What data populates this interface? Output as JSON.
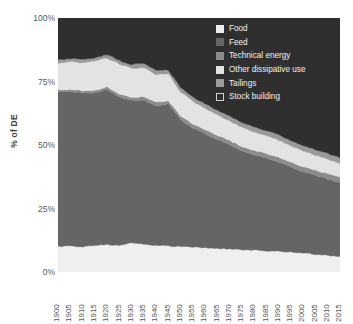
{
  "axes": {
    "ylabel": "% of DE",
    "yticks": [
      "100%",
      "75%",
      "50%",
      "25%",
      "0%"
    ],
    "xticks": [
      "1900",
      "1905",
      "1910",
      "1915",
      "1920",
      "1925",
      "1930",
      "1935",
      "1940",
      "1945",
      "1950",
      "1955",
      "1960",
      "1965",
      "1970",
      "1975",
      "1980",
      "1985",
      "1990",
      "1995",
      "2000",
      "2005",
      "2010",
      "2015"
    ]
  },
  "legend": {
    "items": [
      {
        "label": "Food",
        "color": "#efefef",
        "border": "#efefef"
      },
      {
        "label": "Feed",
        "color": "#656565",
        "border": "#656565"
      },
      {
        "label": "Technical energy",
        "color": "#8c8c8c",
        "border": "#8c8c8c"
      },
      {
        "label": "Other dissipative use",
        "color": "#e3e3e3",
        "border": "#e3e3e3"
      },
      {
        "label": "Tailings",
        "color": "#9a9a9a",
        "border": "#9a9a9a"
      },
      {
        "label": "Stock building",
        "color": "#2f2f2f",
        "border": "#d0d0d0"
      }
    ]
  },
  "chart_data": {
    "type": "area",
    "stacked": true,
    "normalized": true,
    "title": "",
    "xlabel": "",
    "ylabel": "% of DE",
    "ylim": [
      0,
      100
    ],
    "grid": false,
    "legend_position": "top-right",
    "x": [
      1900,
      1905,
      1910,
      1915,
      1920,
      1925,
      1930,
      1935,
      1940,
      1945,
      1950,
      1955,
      1960,
      1965,
      1970,
      1975,
      1980,
      1985,
      1990,
      1995,
      2000,
      2005,
      2010,
      2015
    ],
    "series": [
      {
        "name": "Food",
        "color": "#efefef",
        "values": [
          10.0,
          10.2,
          10.0,
          10.5,
          10.8,
          10.5,
          11.5,
          10.8,
          10.5,
          10.2,
          10.0,
          9.8,
          9.5,
          9.2,
          9.0,
          8.8,
          8.6,
          8.4,
          8.2,
          7.8,
          7.4,
          7.0,
          6.6,
          6.2
        ]
      },
      {
        "name": "Feed",
        "color": "#656565",
        "values": [
          61.0,
          61.0,
          60.5,
          60.0,
          61.0,
          58.5,
          56.0,
          57.0,
          55.0,
          56.0,
          50.0,
          47.0,
          45.0,
          43.0,
          41.0,
          39.0,
          37.5,
          36.5,
          35.0,
          33.5,
          32.0,
          31.0,
          30.0,
          29.0
        ]
      },
      {
        "name": "Technical energy",
        "color": "#8c8c8c",
        "values": [
          0.8,
          0.8,
          0.9,
          0.9,
          1.0,
          1.1,
          1.2,
          1.2,
          1.3,
          1.3,
          1.4,
          1.5,
          1.5,
          1.6,
          1.7,
          1.7,
          1.8,
          1.8,
          1.9,
          1.9,
          2.0,
          2.0,
          2.1,
          2.1
        ]
      },
      {
        "name": "Other dissipative use",
        "color": "#e3e3e3",
        "values": [
          10.5,
          10.8,
          11.0,
          11.5,
          11.5,
          11.8,
          11.5,
          11.5,
          11.0,
          10.5,
          9.5,
          8.8,
          8.5,
          8.0,
          7.8,
          7.5,
          7.2,
          7.0,
          6.8,
          6.5,
          6.2,
          6.0,
          5.8,
          5.5
        ]
      },
      {
        "name": "Tailings",
        "color": "#9a9a9a",
        "values": [
          1.2,
          1.2,
          1.3,
          1.3,
          1.4,
          1.4,
          1.5,
          1.5,
          1.6,
          1.6,
          1.7,
          1.7,
          1.8,
          1.8,
          1.9,
          1.9,
          2.0,
          2.0,
          2.0,
          2.1,
          2.1,
          2.2,
          2.2,
          2.2
        ]
      },
      {
        "name": "Stock building",
        "color": "#2f2f2f",
        "values": [
          16.5,
          16.0,
          16.3,
          15.8,
          14.3,
          16.7,
          18.3,
          18.0,
          20.6,
          20.4,
          27.4,
          31.2,
          33.7,
          36.4,
          38.6,
          41.1,
          42.9,
          44.3,
          46.1,
          48.2,
          50.3,
          51.8,
          53.3,
          55.0
        ]
      }
    ]
  }
}
